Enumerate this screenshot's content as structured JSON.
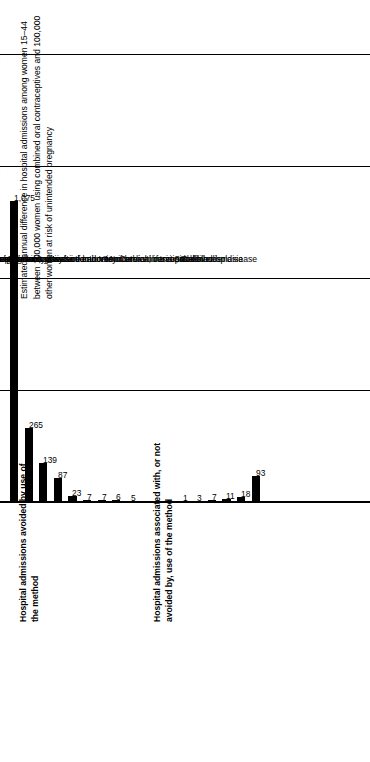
{
  "axis_title": "Estimated annual difference in hospital admissions among women 15–44 between 100,000 women using combined oral contraceptives and 100,000 other women at risk of unintended pregnancy",
  "group_titles": {
    "avoided": "Hospital admissions avoided by use of the method",
    "associated": "Hospital admissions associated with, or not avoided by, use of the method"
  },
  "chart_data": {
    "type": "bar",
    "title": "",
    "orientation": "horizontal",
    "xlabel": "",
    "ylabel": "Estimated annual difference in hospital admissions among women 15–44 between 100,000 women using combined oral contraceptives and 100,000 other women at risk of unintended pregnancy",
    "ylim": [
      0,
      1600
    ],
    "yticks": [
      0,
      400,
      800,
      1200,
      1600
    ],
    "ytick_labels": [
      "0",
      "400",
      "800",
      "1,200",
      "1,600"
    ],
    "grid": true,
    "legend": "none",
    "groups": [
      {
        "name": "Hospital admissions avoided by use of the method",
        "categories": [
          "Cesarean delivery",
          "Spontaneous abortion",
          "Ectopic pregnancy",
          "Ovarian cysts",
          "Benign breast disease",
          "Upper genital tract infection",
          "Urinary tract infection",
          "Complications of induced abortion",
          "Invasive cancers of ovary and endometrium"
        ],
        "values": [
          1075,
          265,
          139,
          87,
          23,
          7,
          7,
          6,
          5
        ],
        "value_labels": [
          "1,075",
          "265",
          "139",
          "87",
          "23",
          "7",
          "7",
          "6",
          "5"
        ]
      },
      {
        "name": "Hospital admissions associated with, or not avoided by, use of the method",
        "categories": [
          "Myocardial infarction",
          "Stroke",
          "Invasive cancers of breast, cervix, and liver",
          "Venous thrombosis and embolism",
          "Cervical intraepithelial neoplasia",
          "Gallbladder disease"
        ],
        "values": [
          1,
          3,
          7,
          11,
          18,
          93
        ],
        "value_labels": [
          "1",
          "3",
          "7",
          "11",
          "18",
          "93"
        ]
      }
    ],
    "categories": [
      "Cesarean delivery",
      "Spontaneous abortion",
      "Ectopic pregnancy",
      "Ovarian cysts",
      "Benign breast disease",
      "Upper genital tract infection",
      "Urinary tract infection",
      "Complications of induced abortion",
      "Invasive cancers of ovary and endometrium",
      "Myocardial infarction",
      "Stroke",
      "Invasive cancers of breast, cervix, and liver",
      "Venous thrombosis and embolism",
      "Cervical intraepithelial neoplasia",
      "Gallbladder disease"
    ],
    "values": [
      1075,
      265,
      139,
      87,
      23,
      7,
      7,
      6,
      5,
      1,
      3,
      7,
      11,
      18,
      93
    ],
    "bar_color": "#000000"
  }
}
